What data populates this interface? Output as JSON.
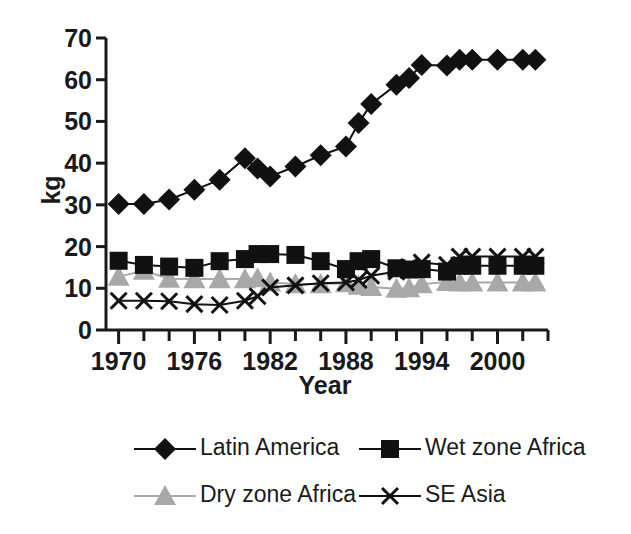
{
  "chart_data": {
    "type": "line",
    "title": "",
    "xlabel": "Year",
    "ylabel": "kg",
    "xlim": [
      1969,
      2004
    ],
    "ylim": [
      0,
      70
    ],
    "ytick_values": [
      0,
      10,
      20,
      30,
      40,
      50,
      60,
      70
    ],
    "ytick_labels": [
      "0",
      "10",
      "20",
      "30",
      "40",
      "50",
      "60",
      "70"
    ],
    "xtick_values": [
      1970,
      1972,
      1974,
      1976,
      1978,
      1980,
      1982,
      1984,
      1986,
      1988,
      1990,
      1992,
      1994,
      1996,
      1998,
      2000,
      2002,
      2004
    ],
    "xtick_labels_shown": [
      "1970",
      "1976",
      "1982",
      "1988",
      "1994",
      "2000"
    ],
    "xtick_labeled_values": [
      1970,
      1976,
      1982,
      1988,
      1994,
      2000
    ],
    "grid": false,
    "legend_position": "bottom",
    "x": [
      1970,
      1972,
      1974,
      1976,
      1978,
      1980,
      1981,
      1982,
      1984,
      1986,
      1988,
      1989,
      1990,
      1992,
      1993,
      1994,
      1996,
      1997,
      1998,
      2000,
      2002,
      2003
    ],
    "series": [
      {
        "name": "Latin America",
        "marker": "diamond",
        "color": "#111111",
        "values": [
          30.2,
          30.2,
          31.3,
          33.6,
          36.0,
          41.2,
          38.7,
          36.8,
          39.2,
          41.9,
          44.0,
          49.6,
          54.2,
          58.8,
          60.4,
          63.5,
          63.4,
          64.8,
          64.8,
          64.8,
          64.8,
          64.8
        ]
      },
      {
        "name": "Wet zone Africa",
        "marker": "square",
        "color": "#111111",
        "values": [
          16.6,
          15.6,
          15.2,
          14.9,
          16.5,
          17.0,
          18.2,
          18.2,
          18.0,
          16.5,
          14.6,
          16.5,
          17.0,
          14.8,
          14.5,
          14.6,
          14.0,
          15.4,
          15.4,
          15.4,
          15.4,
          15.4
        ]
      },
      {
        "name": "Dry zone Africa",
        "marker": "triangle",
        "color": "#a8a8a8",
        "values": [
          12.8,
          14.2,
          12.3,
          12.2,
          12.2,
          12.2,
          12.4,
          11.4,
          11.0,
          11.0,
          11.2,
          10.6,
          10.3,
          9.9,
          10.0,
          11.0,
          11.5,
          11.4,
          11.4,
          11.4,
          11.4,
          11.4
        ]
      },
      {
        "name": "SE Asia",
        "marker": "x",
        "color": "#111111",
        "values": [
          7.0,
          7.0,
          6.9,
          6.2,
          6.0,
          7.0,
          8.1,
          10.2,
          10.7,
          11.2,
          11.4,
          12.0,
          13.0,
          14.0,
          15.1,
          16.2,
          15.6,
          17.6,
          17.6,
          17.6,
          17.6,
          17.6
        ]
      }
    ],
    "series_points": {
      "Latin America": [
        {
          "x": 1970,
          "y": 30.2
        },
        {
          "x": 1971,
          "y": 30.2
        },
        {
          "x": 1972,
          "y": 31.3
        },
        {
          "x": 1974,
          "y": 33.6
        },
        {
          "x": 1975,
          "y": 36.0
        },
        {
          "x": 1977,
          "y": 41.2
        },
        {
          "x": 1978,
          "y": 38.7
        },
        {
          "x": 1979,
          "y": 36.8
        },
        {
          "x": 1981,
          "y": 39.2
        },
        {
          "x": 1982,
          "y": 41.9
        },
        {
          "x": 1984,
          "y": 44.0
        },
        {
          "x": 1986,
          "y": 49.6
        },
        {
          "x": 1987,
          "y": 54.2
        },
        {
          "x": 1989,
          "y": 58.8
        },
        {
          "x": 1990,
          "y": 60.4
        },
        {
          "x": 1992,
          "y": 63.5
        },
        {
          "x": 1994,
          "y": 63.4
        },
        {
          "x": 1995,
          "y": 64.8
        }
      ]
    },
    "annotations": []
  },
  "legend": {
    "entries": [
      {
        "label": "Latin America",
        "marker": "diamond",
        "color": "#111111"
      },
      {
        "label": "Wet zone Africa",
        "marker": "square",
        "color": "#111111"
      },
      {
        "label": "Dry zone Africa",
        "marker": "triangle",
        "color": "#a8a8a8"
      },
      {
        "label": "SE Asia",
        "marker": "x",
        "color": "#111111"
      }
    ]
  },
  "axes": {
    "y_label": "kg",
    "x_label": "Year",
    "y_ticks": [
      "70",
      "60",
      "50",
      "40",
      "30",
      "20",
      "10",
      "0"
    ],
    "x_ticks": [
      "1970",
      "1976",
      "1982",
      "1988",
      "1994",
      "2000"
    ]
  },
  "colors": {
    "axis": "#1a1a1a",
    "dark": "#111111",
    "gray": "#a8a8a8",
    "background": "#ffffff"
  }
}
